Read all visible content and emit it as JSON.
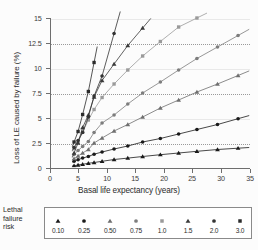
{
  "chart_data": {
    "type": "line",
    "title": "",
    "xlabel": "Basal life expectancy (years)",
    "ylabel": "Loss of LE caused by failure (%)",
    "xlim": [
      0,
      35
    ],
    "ylim": [
      0,
      15
    ],
    "xticks": [
      "0",
      "5",
      "10",
      "15",
      "20",
      "25",
      "30",
      "35"
    ],
    "yticks": [
      "0",
      "2.5",
      "5",
      "7.5",
      "10",
      "12.5",
      "15"
    ],
    "grid": "horizontal",
    "legend_position": "bottom",
    "legend_title": "Lethal failure risk",
    "series": [
      {
        "name": "0.10",
        "marker": "triangle",
        "color": "#1a1a1a",
        "x": [
          4.3,
          5.0,
          5.8,
          6.8,
          7.8,
          9.2,
          11.3,
          13.7,
          16.3,
          19.4,
          22.6,
          25.8,
          29.4,
          33.0
        ],
        "y": [
          0.18,
          0.25,
          0.32,
          0.42,
          0.5,
          0.62,
          0.8,
          0.94,
          1.1,
          1.28,
          1.45,
          1.62,
          1.8,
          1.93
        ]
      },
      {
        "name": "0.25",
        "marker": "circle",
        "color": "#1a1a1a",
        "x": [
          4.3,
          5.0,
          5.8,
          6.8,
          7.8,
          9.2,
          11.3,
          13.7,
          16.3,
          19.4,
          22.6,
          25.8,
          29.4,
          33.0
        ],
        "y": [
          0.62,
          0.78,
          0.95,
          1.1,
          1.33,
          1.55,
          1.85,
          2.15,
          2.55,
          2.9,
          3.35,
          3.8,
          4.3,
          4.88
        ]
      },
      {
        "name": "0.50",
        "marker": "triangle",
        "color": "#6f6f6f",
        "x": [
          4.3,
          5.0,
          5.8,
          6.8,
          7.8,
          9.2,
          11.3,
          13.7,
          16.3,
          19.4,
          22.6,
          25.8,
          29.4,
          33.0
        ],
        "y": [
          0.88,
          1.15,
          1.45,
          1.8,
          2.45,
          2.95,
          3.65,
          4.3,
          5.05,
          5.95,
          6.75,
          7.55,
          8.35,
          9.2
        ]
      },
      {
        "name": "0.75",
        "marker": "circle",
        "color": "#7d7d7d",
        "x": [
          4.3,
          5.0,
          5.8,
          6.8,
          7.8,
          9.2,
          11.3,
          13.7,
          16.3,
          19.4,
          22.6,
          25.8,
          29.4,
          33.0
        ],
        "y": [
          1.3,
          1.7,
          2.1,
          2.6,
          3.5,
          4.45,
          5.25,
          6.35,
          7.45,
          8.55,
          9.75,
          10.9,
          12.05,
          13.2
        ]
      },
      {
        "name": "1.0",
        "marker": "square",
        "color": "#9a9a9a",
        "x": [
          4.3,
          5.0,
          5.8,
          6.8,
          7.8,
          9.2,
          11.3,
          13.7,
          16.3,
          19.4,
          22.6,
          25.8
        ],
        "y": [
          1.9,
          2.55,
          3.55,
          4.75,
          5.8,
          7.0,
          8.35,
          9.75,
          11.15,
          12.6,
          14.05,
          14.95
        ]
      },
      {
        "name": "1.5",
        "marker": "triangle",
        "color": "#3a3a3a",
        "x": [
          4.3,
          5.0,
          5.8,
          6.8,
          7.8,
          9.2,
          11.3,
          13.7,
          16.3
        ],
        "y": [
          1.45,
          2.45,
          4.0,
          5.25,
          7.05,
          8.7,
          10.35,
          12.2,
          13.95
        ]
      },
      {
        "name": "2.0",
        "marker": "circle",
        "color": "#333333",
        "x": [
          4.3,
          5.0,
          5.8,
          6.8,
          7.8,
          9.2,
          11.3
        ],
        "y": [
          2.0,
          2.7,
          3.5,
          5.05,
          7.15,
          9.15,
          13.4
        ]
      },
      {
        "name": "3.0",
        "marker": "square",
        "color": "#2b2b2b",
        "x": [
          4.3,
          5.0,
          5.8,
          6.8,
          7.8
        ],
        "y": [
          2.55,
          3.6,
          5.3,
          7.6,
          10.5
        ]
      }
    ]
  },
  "legend": {
    "title_lines": [
      "Lethal",
      "failure",
      "risk"
    ],
    "entries": [
      {
        "label": "0.10",
        "marker": "triangle",
        "color": "#1a1a1a"
      },
      {
        "label": "0.25",
        "marker": "circle",
        "color": "#1a1a1a"
      },
      {
        "label": "0.50",
        "marker": "triangle",
        "color": "#6f6f6f"
      },
      {
        "label": "0.75",
        "marker": "circle",
        "color": "#7d7d7d"
      },
      {
        "label": "1.0",
        "marker": "square",
        "color": "#9a9a9a"
      },
      {
        "label": "1.5",
        "marker": "triangle",
        "color": "#3a3a3a"
      },
      {
        "label": "2.0",
        "marker": "circle",
        "color": "#333333"
      },
      {
        "label": "3.0",
        "marker": "square",
        "color": "#2b2b2b"
      }
    ]
  }
}
